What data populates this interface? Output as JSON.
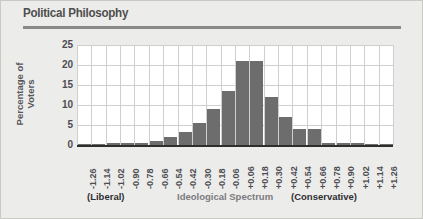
{
  "page": {
    "background_color": "#ececea",
    "title": "Political Philosophy",
    "title_color": "#4e4e4e",
    "rule_color": "#8a8a8a"
  },
  "chart_data": {
    "type": "bar",
    "title": "Political Philosophy",
    "xlabel": "Ideological Spectrum",
    "ylabel": "Percentage of\nVoters",
    "ylim": [
      0,
      25
    ],
    "yticks": [
      0,
      5,
      10,
      15,
      20,
      25
    ],
    "grid": true,
    "legend": "none",
    "bar_color": "#6d6d6d",
    "plot_background": "#ffffff",
    "categories": [
      "-1.26",
      "-1.14",
      "-1.02",
      "-0.90",
      "-0.78",
      "-0.66",
      "-0.54",
      "-0.42",
      "-0.30",
      "-0.18",
      "-0.06",
      "+0.06",
      "+0.18",
      "+0.30",
      "+0.42",
      "+0.54",
      "+0.66",
      "+0.78",
      "+0.90",
      "+1.02",
      "+1.14",
      "+1.26"
    ],
    "values": [
      0.3,
      0.3,
      0.4,
      0.4,
      0.6,
      1.0,
      2.0,
      3.2,
      5.5,
      9.0,
      13.5,
      21.0,
      21.0,
      12.0,
      7.0,
      4.0,
      4.0,
      0.5,
      0.4,
      0.4,
      0.3,
      0.3
    ],
    "annotations": [
      {
        "name": "liberal",
        "text": "(Liberal)"
      },
      {
        "name": "spectrum",
        "text": "Ideological Spectrum"
      },
      {
        "name": "conservative",
        "text": "(Conservative)"
      }
    ]
  }
}
